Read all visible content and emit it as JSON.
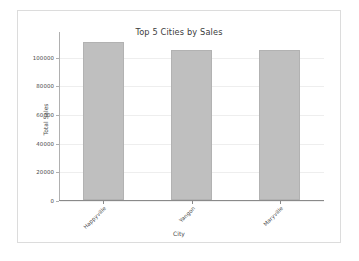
{
  "figure": {
    "background_color": "#ffffff",
    "border_color": "#dcdcdc"
  },
  "chart_data": {
    "type": "bar",
    "title": "Top 5 Cities by Sales",
    "xlabel": "City",
    "ylabel": "Total Sales",
    "categories": [
      "Happyville",
      "Yangon",
      "Maryville"
    ],
    "values": [
      110000,
      105000,
      105000
    ],
    "ylim": [
      0,
      118000
    ],
    "yticks": [
      0,
      20000,
      40000,
      60000,
      80000,
      100000
    ],
    "ytick_labels": [
      "0",
      "20000",
      "40000",
      "60000",
      "80000",
      "100000"
    ],
    "grid": true,
    "grid_axis": "y",
    "legend": null,
    "bar_color": "#bfbfbf",
    "bar_edge_color": "#b2b2b2",
    "xtick_label_rotation": -45
  }
}
